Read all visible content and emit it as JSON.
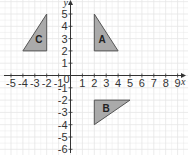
{
  "diagram": {
    "type": "coordinate-grid",
    "x_axis": {
      "label": "x",
      "min": -5,
      "max": 9,
      "ticks": [
        "-5",
        "-4",
        "-3",
        "-2",
        "-1",
        "1",
        "2",
        "3",
        "4",
        "5",
        "6",
        "7",
        "8",
        "9"
      ]
    },
    "y_axis": {
      "label": "y",
      "min": -6,
      "max": 5,
      "ticks": [
        "5",
        "4",
        "3",
        "2",
        "1",
        "-1",
        "-2",
        "-3",
        "-4",
        "-5",
        "-6"
      ]
    },
    "origin_label": "0",
    "colors": {
      "grid": "#e6e6e6",
      "axis": "#333333",
      "shape_fill": "#aaaaaa",
      "shape_stroke": "#555555"
    },
    "shapes": [
      {
        "label": "A",
        "vertices": [
          [
            2,
            5
          ],
          [
            2,
            2
          ],
          [
            4,
            2
          ]
        ]
      },
      {
        "label": "B",
        "vertices": [
          [
            2,
            -2
          ],
          [
            5,
            -2
          ],
          [
            2,
            -4
          ]
        ]
      },
      {
        "label": "C",
        "vertices": [
          [
            -2,
            5
          ],
          [
            -2,
            2
          ],
          [
            -4,
            2
          ]
        ]
      }
    ]
  }
}
